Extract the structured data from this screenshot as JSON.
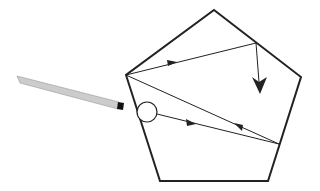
{
  "diagram": {
    "shape": "pentagon",
    "elements": [
      {
        "name": "pentagon",
        "description": "Pentagonal boundary"
      },
      {
        "name": "light-source",
        "description": "Laser pointer / pencil-like light source"
      },
      {
        "name": "circle-entry",
        "description": "Small circle marking entry point"
      },
      {
        "name": "ray-1",
        "description": "Ray from circle to right lower edge, arrow pointing right"
      },
      {
        "name": "ray-2",
        "description": "Reflected ray from right lower edge back to left vertex, arrow pointing left"
      },
      {
        "name": "ray-3",
        "description": "Ray from left vertex to upper right edge, arrow pointing right"
      },
      {
        "name": "ray-4",
        "description": "Final ray downward with large arrowhead"
      }
    ],
    "colors": {
      "stroke": "#222222",
      "source_body": "#cccccc",
      "source_tip": "#111111",
      "background": "#ffffff"
    }
  }
}
